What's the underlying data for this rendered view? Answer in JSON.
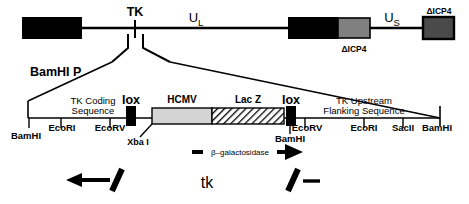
{
  "figure": {
    "colors": {
      "black": "#000000",
      "gray_dark": "#808080",
      "gray_light": "#d4d4d4",
      "white": "#ffffff"
    }
  },
  "genome": {
    "regions": [
      {
        "name": "terminal-repeat-left",
        "label": ""
      },
      {
        "name": "internal-repeat",
        "label": ""
      },
      {
        "name": "terminal-repeat-right",
        "label": ""
      }
    ],
    "labels": {
      "tk": "TK",
      "ul": "U",
      "ul_sub": "L",
      "us": "U",
      "us_sub": "S",
      "delta_icp4_internal": "ΔICP4",
      "delta_icp4_terminal": "ΔICP4"
    }
  },
  "construct": {
    "fragment_label": "BamHI P",
    "features": [
      {
        "name": "tk-coding-sequence",
        "label_line1": "TK Coding",
        "label_line2": "Sequence"
      },
      {
        "name": "lox-left",
        "label": "lox"
      },
      {
        "name": "hcmv-promoter",
        "label": "HCMV"
      },
      {
        "name": "lacz-gene",
        "label": "Lac Z"
      },
      {
        "name": "lox-right",
        "label": "lox"
      },
      {
        "name": "tk-upstream-flanking",
        "label_line1": "TK Upstream",
        "label_line2": "Flanking Sequence"
      }
    ],
    "restriction_sites_upper": [
      {
        "name": "bamhi-left",
        "label": "BamHI"
      },
      {
        "name": "ecori-left",
        "label": "EcoRI"
      },
      {
        "name": "ecorv-left",
        "label": "EcoRV"
      },
      {
        "name": "xbai",
        "label": "Xba I"
      },
      {
        "name": "bamhi-mid",
        "label": "BamHI"
      },
      {
        "name": "ecorv-right",
        "label": "EcoRV"
      },
      {
        "name": "ecori-right",
        "label": "EcoRI"
      },
      {
        "name": "sacii",
        "label": "SacII"
      },
      {
        "name": "bamhi-right",
        "label": "BamHI"
      }
    ],
    "transcript": {
      "label": "β–galactosidase",
      "direction": "right"
    }
  },
  "bottom": {
    "left_allele": {
      "name": "tk-minus-left",
      "label": ""
    },
    "locus_label": "tk",
    "right_allele": {
      "name": "tk-minus-right",
      "label": ""
    }
  }
}
